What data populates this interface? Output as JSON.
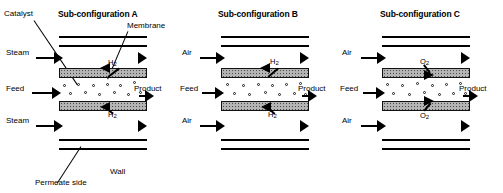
{
  "figure": {
    "caption_title": "Membrane reactor sub-configurations",
    "panels": [
      {
        "id": "A",
        "title": "Sub-configuration A",
        "annotations": {
          "catalyst": "Catalyst",
          "membrane": "Membrane",
          "wall": "Wall",
          "permeate_side": "Permeate side"
        },
        "inlets": [
          {
            "name": "top-inlet",
            "label": "Steam"
          },
          {
            "name": "feed-inlet",
            "label": "Feed"
          },
          {
            "name": "bottom-inlet",
            "label": "Steam"
          }
        ],
        "outlets": [
          {
            "name": "product-outlet",
            "label": "Product"
          }
        ],
        "permeation": [
          {
            "name": "top-permeation",
            "species": "H",
            "subscript": "2",
            "direction": "out-of-feed"
          },
          {
            "name": "bottom-permeation",
            "species": "H",
            "subscript": "2",
            "direction": "out-of-feed"
          }
        ]
      },
      {
        "id": "B",
        "title": "Sub-configuration B",
        "annotations": {},
        "inlets": [
          {
            "name": "top-inlet",
            "label": "Air"
          },
          {
            "name": "feed-inlet",
            "label": "Feed"
          },
          {
            "name": "bottom-inlet",
            "label": "Air"
          }
        ],
        "outlets": [
          {
            "name": "product-outlet",
            "label": "Product"
          }
        ],
        "permeation": [
          {
            "name": "top-permeation",
            "species": "H",
            "subscript": "2",
            "direction": "out-of-feed"
          },
          {
            "name": "bottom-permeation",
            "species": "H",
            "subscript": "2",
            "direction": "out-of-feed"
          }
        ]
      },
      {
        "id": "C",
        "title": "Sub-configuration C",
        "annotations": {},
        "inlets": [
          {
            "name": "top-inlet",
            "label": "Air"
          },
          {
            "name": "feed-inlet",
            "label": "Feed"
          },
          {
            "name": "bottom-inlet",
            "label": "Air"
          }
        ],
        "outlets": [
          {
            "name": "product-outlet",
            "label": "Product"
          }
        ],
        "permeation": [
          {
            "name": "top-permeation",
            "species": "O",
            "subscript": "2",
            "direction": "into-feed"
          },
          {
            "name": "bottom-permeation",
            "species": "O",
            "subscript": "2",
            "direction": "into-feed"
          }
        ]
      }
    ],
    "colors": {
      "line": "#000000",
      "membrane_fill": "#b4b4b4",
      "background": "#ffffff"
    }
  }
}
